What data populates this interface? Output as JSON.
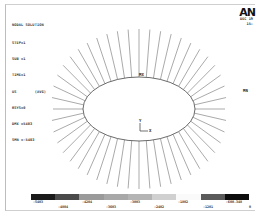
{
  "window": {
    "logo": "AN",
    "date_line1": "DEC 19",
    "date_line2": "15:"
  },
  "info": {
    "title": "NODAL SOLUTION",
    "lines": [
      "STEP=1",
      "SUB =1",
      "TIME=1",
      "US        (AVG)",
      "RSYS=0",
      "DMX =5403",
      "SMN =-5403"
    ]
  },
  "plot": {
    "max_label": "MX",
    "min_label": "MN",
    "axis_x": "X",
    "axis_y": "Y",
    "ellipse": {
      "cx": 139,
      "cy": 109,
      "rx": 56,
      "ry": 32
    },
    "vector_count": 48,
    "line_color": "#555555"
  },
  "legend": {
    "colors": [
      "#1a1a1a",
      "#4a4a4a",
      "#9a9a9a",
      "#a8a8a8",
      "#b4b4b4",
      "#d0d0d0",
      "#fafafa",
      "#5a5a5a",
      "#0d0d0d"
    ],
    "top_labels": [
      {
        "text": "-5403",
        "x": 38
      },
      {
        "text": "-4204",
        "x": 87
      },
      {
        "text": "-3003",
        "x": 135
      },
      {
        "text": "-1802",
        "x": 183
      },
      {
        "text": "-600.348",
        "x": 234
      }
    ],
    "bottom_labels": [
      {
        "text": "-4804",
        "x": 63
      },
      {
        "text": "-3603",
        "x": 111
      },
      {
        "text": "-2402",
        "x": 159
      },
      {
        "text": "-1201",
        "x": 208
      },
      {
        "text": "0",
        "x": 250
      }
    ]
  }
}
